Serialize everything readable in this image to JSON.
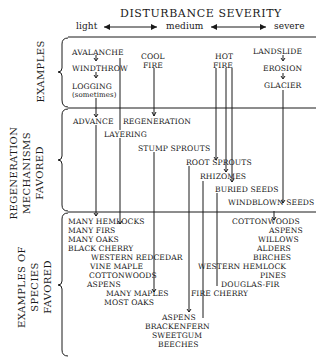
{
  "header": {
    "title": "DISTURBANCE SEVERITY",
    "scale": {
      "light": "light",
      "medium": "medium",
      "severe": "severe"
    }
  },
  "sections": {
    "examples": "EXAMPLES",
    "regeneration": [
      "REGENERATION",
      "MECHANISMS",
      "FAVORED"
    ],
    "species": [
      "EXAMPLES OF SPECIES",
      "FAVORED"
    ]
  },
  "examples": {
    "avalanche": "AVALANCHE",
    "windthrow": "WINDTHROW",
    "logging": "LOGGING",
    "logging_note": "(sometimes)",
    "cool_fire_1": "COOL",
    "cool_fire_2": "FIRE",
    "hot_fire_1": "HOT",
    "hot_fire_2": "FIRE",
    "landslide": "LANDSLIDE",
    "erosion": "EROSION",
    "glacier": "GLACIER"
  },
  "mechanisms": {
    "advance": "ADVANCE",
    "regeneration": "REGENERATION",
    "layering": "LAYERING",
    "stump_sprouts": "STUMP  SPROUTS",
    "root_sprouts": "ROOT  SPROUTS",
    "rhizomes": "RHIZOMES",
    "buried_seeds": "BURIED  SEEDS",
    "windblown_seeds": "WINDBLOWN SEEDS"
  },
  "species": {
    "left": [
      "MANY  HEMLOCKS",
      "MANY  FIRS",
      "MANY  OAKS",
      "BLACK  CHERRY"
    ],
    "left_indent": [
      "WESTERN  REDCEDAR",
      "VINE MAPLE",
      "COTTONWOODS",
      "ASPENS"
    ],
    "maples": [
      "MANY  MAPLES",
      "MOST  OAKS"
    ],
    "bottom": [
      "ASPENS",
      "BRACKENFERN",
      "SWEETGUM",
      "BEECHES"
    ],
    "fire_cherry": "FIRE  CHERRY",
    "right": [
      "COTTONWOODS",
      "ASPENS",
      "WILLOWS",
      "ALDERS",
      "BIRCHES",
      "WESTERN  HEMLOCK",
      "PINES",
      "DOUGLAS-FIR"
    ]
  }
}
